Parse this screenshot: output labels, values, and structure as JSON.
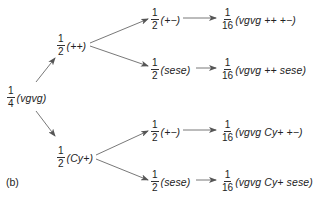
{
  "figure_label": "(b)",
  "root": {
    "num": "1",
    "den": "4",
    "expr": "(vgvg)"
  },
  "level1": [
    {
      "num": "1",
      "den": "2",
      "expr": "(++)"
    },
    {
      "num": "1",
      "den": "2",
      "expr": "(Cy+)"
    }
  ],
  "level2": [
    {
      "num": "1",
      "den": "2",
      "expr": "(+−)"
    },
    {
      "num": "1",
      "den": "2",
      "expr": "(sese)"
    },
    {
      "num": "1",
      "den": "2",
      "expr": "(+−)"
    },
    {
      "num": "1",
      "den": "2",
      "expr": "(sese)"
    }
  ],
  "results": [
    {
      "num": "1",
      "den": "16",
      "expr": "(vgvg  ++  +−)"
    },
    {
      "num": "1",
      "den": "16",
      "expr": "(vgvg  ++  sese)"
    },
    {
      "num": "1",
      "den": "16",
      "expr": "(vgvg  Cy+  +−)"
    },
    {
      "num": "1",
      "den": "16",
      "expr": "(vgvg  Cy+  sese)"
    }
  ],
  "colors": {
    "arrow": "#555555",
    "text": "#222222"
  }
}
